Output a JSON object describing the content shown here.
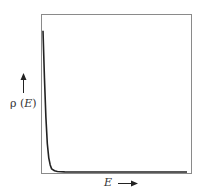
{
  "chart_data": {
    "type": "line",
    "title": "",
    "xlabel": "E",
    "ylabel": "ρ (E)",
    "x_arrow": "right",
    "y_arrow": "up",
    "grid": false,
    "legend": null,
    "ticks": "none",
    "series": [
      {
        "name": "ρ(E)",
        "description": "sharply decaying density: very high near E=0, falling rapidly to ~0 and staying flat",
        "x": [
          0.0,
          0.01,
          0.02,
          0.03,
          0.04,
          0.05,
          0.06,
          0.08,
          0.1,
          0.15,
          0.3,
          0.5,
          0.75,
          1.0
        ],
        "values": [
          0.9,
          0.6,
          0.35,
          0.18,
          0.09,
          0.045,
          0.02,
          0.008,
          0.003,
          0.001,
          0.0,
          0.0,
          0.0,
          0.0
        ]
      }
    ],
    "xlim": [
      0,
      1
    ],
    "ylim": [
      0,
      1
    ]
  },
  "labels": {
    "y_rho": "ρ",
    "y_open": " (",
    "y_E": "E",
    "y_close": ")",
    "x_E": "E"
  },
  "colors": {
    "frame": "#8a8a8a",
    "curve": "#222222",
    "text": "#333333"
  }
}
